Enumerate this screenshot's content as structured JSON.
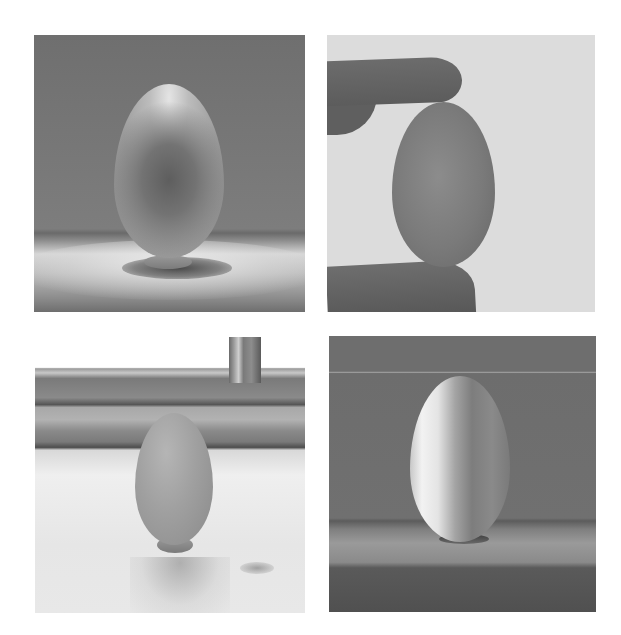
{
  "figure": {
    "layout": "2x2 grid",
    "colors": {
      "background": "#ffffff",
      "tone": "grayscale"
    },
    "panels": [
      {
        "id": "p1",
        "position": "top-left",
        "subject": "wooden egg on small stand",
        "setting": "dark gray backdrop with spotlight on table surface",
        "alt": "Wooden egg standing on a small base under a spotlight"
      },
      {
        "id": "p2",
        "position": "top-right",
        "subject": "wooden egg held between two fingers",
        "setting": "light gray backdrop",
        "alt": "Wooden egg pinched between thumb and finger"
      },
      {
        "id": "p3",
        "position": "bottom-left",
        "subject": "wooden egg on small stand",
        "setting": "windowsill with window frame behind",
        "alt": "Wooden egg standing on a windowsill"
      },
      {
        "id": "p4",
        "position": "bottom-right",
        "subject": "wooden egg on small stand",
        "setting": "dark backdrop, strong side light from left",
        "alt": "Side-lit wooden egg on a ledge"
      }
    ]
  }
}
